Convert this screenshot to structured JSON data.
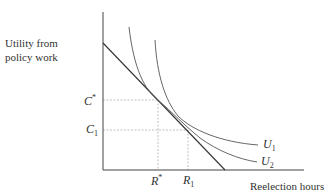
{
  "axes": {
    "y_label_line1": "Utility from",
    "y_label_line2": "policy work",
    "x_label": "Reelection hours"
  },
  "y_ticks": [
    {
      "symbol": "C",
      "mark": "*",
      "label": "C*"
    },
    {
      "symbol": "C",
      "sub": "1",
      "label": "C1"
    }
  ],
  "x_ticks": [
    {
      "symbol": "R",
      "mark": "*",
      "label": "R*"
    },
    {
      "symbol": "R",
      "sub": "1",
      "label": "R1"
    }
  ],
  "curves": [
    {
      "symbol": "U",
      "sub": "1",
      "label": "U1"
    },
    {
      "symbol": "U",
      "sub": "2",
      "label": "U2"
    }
  ],
  "colors": {
    "axis": "#444444",
    "curve": "#555555",
    "budget_line": "#333333",
    "guide": "#aaaaaa"
  }
}
